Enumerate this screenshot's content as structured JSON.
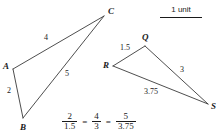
{
  "figure": {
    "background_color": "#ffffff",
    "line_color": "#3a3a3a",
    "text_color": "#1a1a1a"
  },
  "scale_key": {
    "label": "1 unit",
    "bar_name": "scale-bar"
  },
  "triangle_abc": {
    "name": "triangle-ABC",
    "vertices": [
      {
        "id": "A",
        "label": "A",
        "x": 13,
        "y": 69
      },
      {
        "id": "B",
        "label": "B",
        "x": 23,
        "y": 118
      },
      {
        "id": "C",
        "label": "C",
        "x": 104,
        "y": 16
      }
    ],
    "sides": [
      {
        "id": "AC",
        "label": "4",
        "from": "A",
        "to": "C"
      },
      {
        "id": "AB",
        "label": "2",
        "from": "A",
        "to": "B"
      },
      {
        "id": "BC",
        "label": "5",
        "from": "B",
        "to": "C"
      }
    ]
  },
  "triangle_qrs": {
    "name": "triangle-QRS",
    "vertices": [
      {
        "id": "Q",
        "label": "Q",
        "x": 145,
        "y": 46
      },
      {
        "id": "R",
        "label": "R",
        "x": 113,
        "y": 66
      },
      {
        "id": "S",
        "label": "S",
        "x": 208,
        "y": 104
      }
    ],
    "sides": [
      {
        "id": "RQ",
        "label": "1.5",
        "from": "R",
        "to": "Q"
      },
      {
        "id": "QS",
        "label": "3",
        "from": "Q",
        "to": "S"
      },
      {
        "id": "RS",
        "label": "3.75",
        "from": "R",
        "to": "S"
      }
    ]
  },
  "proportion": {
    "name": "proportion-equation",
    "fractions": [
      {
        "numerator": "2",
        "denominator": "1.5"
      },
      {
        "numerator": "4",
        "denominator": "3"
      },
      {
        "numerator": "5",
        "denominator": "3.75"
      }
    ],
    "equals": "="
  }
}
